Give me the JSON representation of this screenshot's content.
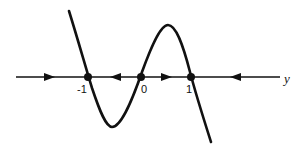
{
  "diagram": {
    "type": "phase-line",
    "axis_label": "y",
    "equilibria": [
      {
        "value": -1,
        "label": "-1",
        "x": 88
      },
      {
        "value": 0,
        "label": "0",
        "x": 141
      },
      {
        "value": 1,
        "label": "1",
        "x": 191
      }
    ],
    "flow_directions": [
      {
        "interval": "y < -1",
        "direction": "right"
      },
      {
        "interval": "-1 < y < 0",
        "direction": "left"
      },
      {
        "interval": "0 < y < 1",
        "direction": "right"
      },
      {
        "interval": "y > 1",
        "direction": "left"
      }
    ],
    "curve": "cubic f(y) with roots at -1, 0, 1; positive for y < -1, negative between -1 and 0, positive between 0 and 1, negative for y > 1",
    "colors": {
      "stroke": "#111111",
      "background": "#ffffff"
    }
  }
}
